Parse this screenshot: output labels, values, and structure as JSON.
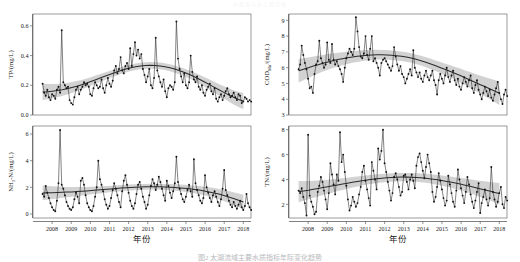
{
  "figure": {
    "top_header": "水资源与水工程学报",
    "caption": "图2  太湖流域主要水质指标年际变化趋势",
    "xlabel": "年份",
    "xticks": [
      "2008",
      "2009",
      "2010",
      "2011",
      "2012",
      "2013",
      "2014",
      "2015",
      "2016",
      "2017",
      "2018"
    ],
    "xlim": [
      2007.5,
      2018.9
    ],
    "colors": {
      "point": "#111111",
      "line": "#1d1d1d",
      "trend": "#2b2b2b",
      "band": "#b6b6b6",
      "frame": "#6f6f6f"
    }
  },
  "chart_data": [
    {
      "type": "line",
      "panel": "top-left",
      "title": "",
      "ylabel": "TP/(mg/L)",
      "xlabel": "年份",
      "ylim": [
        0.0,
        0.68
      ],
      "yticks": [
        0.0,
        0.2,
        0.4,
        0.6
      ],
      "ytick_labels": [
        "0.0",
        "0.2",
        "0.4",
        "0.6"
      ],
      "grid": false,
      "legend": "none",
      "x_start": 2008.0,
      "x_step": 0.0833,
      "values": [
        0.21,
        0.15,
        0.13,
        0.17,
        0.12,
        0.1,
        0.14,
        0.13,
        0.11,
        0.17,
        0.19,
        0.15,
        0.57,
        0.22,
        0.2,
        0.18,
        0.19,
        0.1,
        0.08,
        0.07,
        0.12,
        0.17,
        0.19,
        0.14,
        0.17,
        0.19,
        0.22,
        0.2,
        0.21,
        0.19,
        0.14,
        0.13,
        0.18,
        0.22,
        0.2,
        0.18,
        0.19,
        0.24,
        0.18,
        0.15,
        0.2,
        0.25,
        0.21,
        0.19,
        0.23,
        0.3,
        0.33,
        0.28,
        0.31,
        0.39,
        0.3,
        0.28,
        0.33,
        0.35,
        0.31,
        0.45,
        0.33,
        0.41,
        0.49,
        0.4,
        0.44,
        0.38,
        0.41,
        0.31,
        0.27,
        0.22,
        0.26,
        0.31,
        0.2,
        0.18,
        0.25,
        0.52,
        0.3,
        0.26,
        0.22,
        0.19,
        0.24,
        0.16,
        0.12,
        0.18,
        0.2,
        0.19,
        0.17,
        0.22,
        0.63,
        0.38,
        0.31,
        0.26,
        0.22,
        0.28,
        0.2,
        0.18,
        0.22,
        0.4,
        0.29,
        0.24,
        0.22,
        0.26,
        0.19,
        0.17,
        0.2,
        0.15,
        0.13,
        0.17,
        0.19,
        0.21,
        0.16,
        0.14,
        0.18,
        0.11,
        0.09,
        0.12,
        0.14,
        0.1,
        0.13,
        0.16,
        0.18,
        0.14,
        0.12,
        0.13,
        0.15,
        0.12,
        0.1,
        0.14,
        0.13,
        0.08,
        0.09,
        0.12,
        0.11,
        0.09,
        0.1,
        0.09
      ],
      "trend": [
        0.155,
        0.157,
        0.16,
        0.164,
        0.17,
        0.177,
        0.185,
        0.194,
        0.204,
        0.215,
        0.227,
        0.24,
        0.252,
        0.264,
        0.276,
        0.288,
        0.299,
        0.309,
        0.318,
        0.325,
        0.33,
        0.333,
        0.334,
        0.333,
        0.33,
        0.325,
        0.318,
        0.309,
        0.298,
        0.286,
        0.272,
        0.257,
        0.241,
        0.224,
        0.206,
        0.188,
        0.17,
        0.152,
        0.135,
        0.119,
        0.105,
        0.094
      ],
      "trend_band": 0.022
    },
    {
      "type": "line",
      "panel": "top-right",
      "title": "",
      "ylabel": "CODMn/(mg/L)",
      "ylabel_base": "COD",
      "ylabel_sub": "Mn",
      "ylabel_unit": "/(mg/L)",
      "xlabel": "年份",
      "ylim": [
        3.0,
        9.4
      ],
      "yticks": [
        3,
        4,
        5,
        6,
        7,
        8,
        9
      ],
      "ytick_labels": [
        "3",
        "4",
        "5",
        "6",
        "7",
        "8",
        "9"
      ],
      "grid": false,
      "legend": "none",
      "x_start": 2008.0,
      "x_step": 0.0833,
      "values": [
        5.9,
        6.2,
        7.4,
        6.8,
        6.3,
        5.9,
        5.3,
        4.7,
        4.8,
        4.4,
        5.6,
        6.2,
        6.4,
        7.7,
        6.6,
        6.3,
        6.0,
        6.2,
        7.6,
        6.5,
        6.3,
        7.5,
        6.5,
        6.2,
        6.4,
        6.1,
        5.9,
        5.6,
        5.1,
        6.0,
        6.6,
        6.9,
        7.2,
        7.0,
        6.8,
        7.2,
        9.2,
        8.3,
        7.3,
        6.7,
        6.6,
        6.9,
        8.0,
        6.8,
        6.5,
        7.2,
        8.0,
        6.4,
        6.6,
        6.3,
        6.0,
        5.5,
        6.3,
        6.5,
        6.6,
        6.4,
        6.2,
        6.0,
        5.8,
        6.1,
        7.3,
        6.7,
        6.2,
        5.8,
        6.1,
        5.6,
        5.4,
        5.0,
        5.3,
        5.6,
        5.9,
        5.5,
        7.1,
        6.0,
        5.7,
        5.4,
        5.7,
        5.3,
        5.1,
        5.5,
        5.8,
        5.4,
        5.2,
        5.5,
        5.8,
        5.2,
        4.9,
        4.3,
        5.2,
        5.6,
        5.3,
        5.0,
        5.5,
        6.0,
        5.4,
        5.1,
        5.5,
        5.8,
        5.2,
        4.9,
        5.3,
        4.8,
        4.6,
        5.0,
        5.4,
        5.1,
        4.8,
        5.2,
        5.5,
        4.7,
        4.4,
        4.9,
        5.2,
        4.6,
        4.3,
        4.0,
        4.4,
        4.8,
        4.5,
        4.2,
        4.6,
        4.1,
        3.9,
        4.3,
        4.7,
        5.1,
        4.4,
        4.0,
        3.7,
        4.3,
        4.6,
        4.2
      ],
      "trend": [
        5.8,
        5.9,
        6.0,
        6.1,
        6.19,
        6.28,
        6.36,
        6.44,
        6.51,
        6.57,
        6.63,
        6.68,
        6.72,
        6.76,
        6.79,
        6.81,
        6.82,
        6.82,
        6.81,
        6.79,
        6.76,
        6.72,
        6.67,
        6.61,
        6.53,
        6.44,
        6.34,
        6.23,
        6.12,
        6.0,
        5.88,
        5.76,
        5.63,
        5.5,
        5.36,
        5.22,
        5.08,
        4.94,
        4.8,
        4.66,
        4.52,
        4.38
      ],
      "trend_band": 0.3
    },
    {
      "type": "line",
      "panel": "bottom-left",
      "title": "",
      "ylabel": "NH3-N/(mg/L)",
      "ylabel_base": "NH",
      "ylabel_sub": "3",
      "ylabel_unit": "-N/(mg/L)",
      "xlabel": "年份",
      "ylim": [
        -0.3,
        6.6
      ],
      "yticks": [
        0,
        2,
        4,
        6
      ],
      "ytick_labels": [
        "0",
        "2",
        "4",
        "6"
      ],
      "grid": false,
      "legend": "none",
      "x_start": 2008.0,
      "x_step": 0.0833,
      "values": [
        1.5,
        1.3,
        2.1,
        1.6,
        1.2,
        0.8,
        0.5,
        0.3,
        0.2,
        1.0,
        2.3,
        6.3,
        2.2,
        1.9,
        1.4,
        0.9,
        0.6,
        0.4,
        0.3,
        0.5,
        1.1,
        1.6,
        1.3,
        0.8,
        2.5,
        2.7,
        2.2,
        1.4,
        0.8,
        0.5,
        0.3,
        0.2,
        0.6,
        1.3,
        2.0,
        4.0,
        2.6,
        2.2,
        1.7,
        1.1,
        0.7,
        0.4,
        0.6,
        1.2,
        1.8,
        2.3,
        1.9,
        1.4,
        0.9,
        0.5,
        1.7,
        2.5,
        2.9,
        2.2,
        1.6,
        1.0,
        0.6,
        0.4,
        0.8,
        1.5,
        2.2,
        2.4,
        1.9,
        1.3,
        0.9,
        0.4,
        0.7,
        1.4,
        2.1,
        2.6,
        2.3,
        1.8,
        2.2,
        2.8,
        2.4,
        1.9,
        1.4,
        1.0,
        2.5,
        2.1,
        1.6,
        1.2,
        1.7,
        2.3,
        4.3,
        2.4,
        1.9,
        1.5,
        1.1,
        0.9,
        1.3,
        1.8,
        2.2,
        1.7,
        1.3,
        4.1,
        2.3,
        1.8,
        1.4,
        1.0,
        0.8,
        1.2,
        2.9,
        2.0,
        1.6,
        1.2,
        0.9,
        1.4,
        1.7,
        1.3,
        0.9,
        0.6,
        1.1,
        1.9,
        3.3,
        1.8,
        1.4,
        1.0,
        0.7,
        0.5,
        0.9,
        0.6,
        0.4,
        0.7,
        1.0,
        0.5,
        0.3,
        0.6,
        1.5,
        0.8,
        0.5,
        0.3
      ],
      "trend": [
        1.58,
        1.59,
        1.6,
        1.61,
        1.63,
        1.64,
        1.66,
        1.68,
        1.7,
        1.73,
        1.76,
        1.79,
        1.82,
        1.85,
        1.88,
        1.91,
        1.94,
        1.97,
        1.99,
        2.01,
        2.03,
        2.04,
        2.05,
        2.05,
        2.04,
        2.03,
        2.01,
        1.99,
        1.96,
        1.93,
        1.89,
        1.84,
        1.79,
        1.73,
        1.66,
        1.58,
        1.49,
        1.39,
        1.28,
        1.16,
        1.03,
        0.89
      ],
      "trend_band": 0.22
    },
    {
      "type": "line",
      "panel": "bottom-right",
      "title": "",
      "ylabel": "TN/(mg/L)",
      "xlabel": "年份",
      "ylim": [
        0.9,
        8.3
      ],
      "yticks": [
        2,
        4,
        6,
        8
      ],
      "ytick_labels": [
        "2",
        "4",
        "6",
        "8"
      ],
      "grid": false,
      "legend": "none",
      "x_start": 2008.0,
      "x_step": 0.0833,
      "values": [
        3.1,
        2.9,
        3.3,
        2.6,
        2.1,
        1.1,
        7.6,
        2.7,
        2.2,
        1.8,
        1.2,
        1.4,
        3.0,
        3.5,
        4.2,
        3.8,
        3.1,
        2.4,
        1.6,
        2.9,
        5.3,
        4.4,
        3.6,
        2.8,
        4.4,
        3.9,
        7.8,
        5.4,
        6.0,
        4.6,
        3.5,
        2.4,
        1.5,
        1.9,
        2.6,
        2.2,
        1.8,
        2.1,
        2.8,
        3.4,
        4.6,
        5.1,
        3.9,
        3.2,
        2.5,
        1.9,
        5.4,
        4.7,
        4.0,
        3.2,
        6.5,
        5.6,
        6.3,
        8.0,
        5.3,
        4.6,
        3.8,
        3.1,
        2.3,
        2.9,
        4.2,
        4.5,
        4.0,
        3.4,
        2.7,
        3.0,
        4.3,
        4.4,
        3.8,
        3.2,
        4.0,
        4.4,
        3.9,
        3.3,
        5.1,
        5.8,
        6.1,
        5.4,
        4.7,
        4.1,
        5.0,
        6.0,
        5.3,
        4.6,
        3.0,
        2.2,
        2.6,
        3.4,
        4.5,
        3.9,
        3.2,
        2.5,
        1.9,
        2.3,
        4.3,
        3.6,
        2.9,
        2.2,
        1.8,
        3.1,
        4.8,
        4.0,
        3.3,
        2.7,
        2.1,
        3.0,
        4.2,
        3.6,
        2.8,
        2.2,
        1.7,
        2.3,
        3.0,
        3.7,
        1.3,
        2.1,
        2.6,
        3.2,
        2.4,
        1.9,
        2.5,
        5.0,
        3.0,
        2.4,
        1.8,
        2.2,
        2.9,
        3.4,
        2.0,
        1.7,
        2.6,
        2.3
      ],
      "trend": [
        3.02,
        3.08,
        3.14,
        3.21,
        3.28,
        3.35,
        3.42,
        3.49,
        3.56,
        3.63,
        3.7,
        3.77,
        3.84,
        3.9,
        3.96,
        4.01,
        4.06,
        4.1,
        4.13,
        4.16,
        4.18,
        4.19,
        4.19,
        4.18,
        4.16,
        4.13,
        4.09,
        4.04,
        3.99,
        3.93,
        3.86,
        3.79,
        3.71,
        3.63,
        3.54,
        3.45,
        3.36,
        3.26,
        3.16,
        3.06,
        2.96,
        2.86
      ],
      "trend_band": 0.34
    }
  ]
}
